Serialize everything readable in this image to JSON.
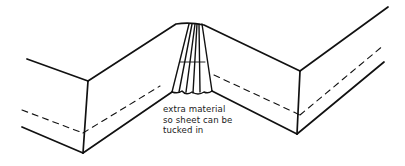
{
  "diagram": {
    "annotation": {
      "lines": [
        "extra material",
        "so sheet can be",
        "tucked in"
      ]
    },
    "colors": {
      "stroke": "#111111",
      "background": "#ffffff",
      "text": "#1a1a1a"
    }
  }
}
